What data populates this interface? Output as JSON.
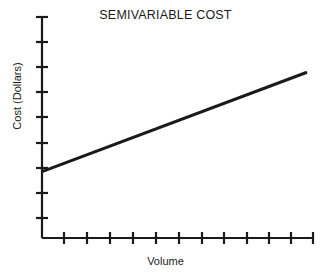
{
  "chart_data": {
    "type": "line",
    "title": "SEMIVARIABLE COST",
    "xlabel": "Volume",
    "ylabel": "Cost (Dollars)",
    "grid": false,
    "legend": null,
    "series": [
      {
        "name": "Semivariable cost",
        "x": [
          0,
          100
        ],
        "y": [
          30,
          75
        ],
        "color": "#1a1a1a",
        "line_width": 3,
        "description": "Straight line beginning above the origin at a positive fixed-cost intercept and rising steadily with volume"
      }
    ],
    "x": [
      0,
      100
    ],
    "values": [
      30,
      75
    ],
    "xlim": [
      0,
      100
    ],
    "ylim": [
      0,
      100
    ],
    "x_tick_count": 12,
    "y_tick_count": 9,
    "x_tick_labels": [],
    "y_tick_labels": [],
    "annotations": [],
    "axis_color": "#1a1a1a",
    "background": "#ffffff"
  },
  "figure": {
    "title": "SEMIVARIABLE COST",
    "x_axis_label": "Volume",
    "y_axis_label": "Cost (Dollars)"
  }
}
